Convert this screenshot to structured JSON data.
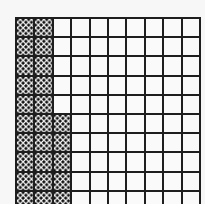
{
  "figure": {
    "type": "hundred-grid",
    "rows": 10,
    "columns": 10,
    "shaded_per_row": [
      2,
      2,
      2,
      2,
      2,
      3,
      3,
      3,
      3,
      3
    ],
    "shaded_total": 25,
    "total_cells": 100,
    "shading_pattern": "dots",
    "colors": {
      "grid_line": "#1e1e1e",
      "cell_background": "#fafafa",
      "dot": "#111111",
      "page_background": "#f7f7f7"
    }
  }
}
